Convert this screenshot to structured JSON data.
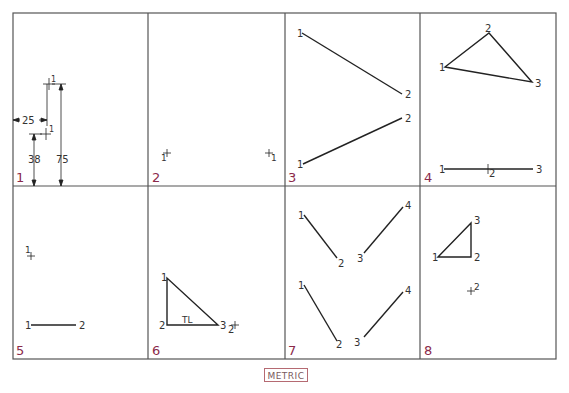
{
  "colors": {
    "frame": "#555555",
    "ink": "#222222",
    "panel_number": "#8b2a4a",
    "label": "#333333",
    "metric_border": "#b56a72",
    "metric_text": "#7a5a5e"
  },
  "frame": {
    "x": 13,
    "y": 13,
    "width": 543,
    "height": 346
  },
  "grid": {
    "cols_x": [
      13,
      148,
      285,
      420,
      556
    ],
    "rows_y": [
      13,
      186,
      359
    ]
  },
  "footer": {
    "label": "METRIC"
  },
  "panels": [
    {
      "number": "1",
      "dimensions": {
        "horizontal": "25",
        "vertical_low": "38",
        "vertical_high": "75"
      },
      "point_labels": [
        "1",
        "1"
      ]
    },
    {
      "number": "2",
      "point_labels": [
        "1",
        "1"
      ]
    },
    {
      "number": "3",
      "lines": [
        {
          "from": "1",
          "to": "2"
        },
        {
          "from": "1",
          "to": "2"
        }
      ]
    },
    {
      "number": "4",
      "triangle": [
        "1",
        "2",
        "3"
      ],
      "edge_view_labels": [
        "1",
        "2",
        "3"
      ]
    },
    {
      "number": "5",
      "point_label": "1",
      "line": {
        "from": "1",
        "to": "2"
      }
    },
    {
      "number": "6",
      "triangle": [
        "1",
        "2",
        "3"
      ],
      "true_length_label": "TL",
      "point_label": "2"
    },
    {
      "number": "7",
      "upper_lines": [
        {
          "from": "1",
          "to": "2"
        },
        {
          "from": "3",
          "to": "4"
        }
      ],
      "lower_lines": [
        {
          "from": "1",
          "to": "2"
        },
        {
          "from": "3",
          "to": "4"
        }
      ]
    },
    {
      "number": "8",
      "triangle": [
        "1",
        "2",
        "3"
      ],
      "point_label": "2"
    }
  ]
}
